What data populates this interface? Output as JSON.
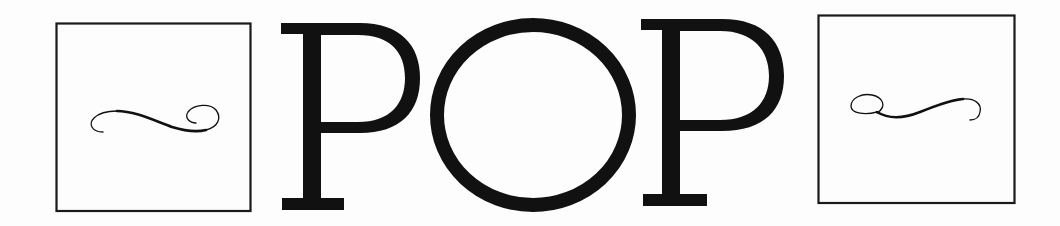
{
  "title": {
    "text": "POP",
    "letters": [
      "P",
      "O",
      "P"
    ]
  },
  "ornaments": {
    "left": {
      "icon": "flourish-swash-icon",
      "frame": "square-frame"
    },
    "right": {
      "icon": "flourish-swash-icon-mirrored",
      "frame": "square-frame"
    }
  },
  "colors": {
    "ink": "#111111",
    "background": "#fdfdfd"
  }
}
